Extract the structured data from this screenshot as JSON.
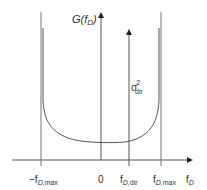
{
  "diagram": {
    "y_axis_label": "G(f_D)",
    "x_axis_label": "f_D",
    "ticks": [
      {
        "id": "neg_max",
        "label": "-f_D,max"
      },
      {
        "id": "zero",
        "label": "0"
      },
      {
        "id": "dir",
        "label": "f_D,dir"
      },
      {
        "id": "pos_max",
        "label": "f_D,max"
      }
    ],
    "direct_component_label": "σ²_dir",
    "colors": {
      "line": "#555555",
      "text": "#333333",
      "background": "#ffffff"
    }
  }
}
